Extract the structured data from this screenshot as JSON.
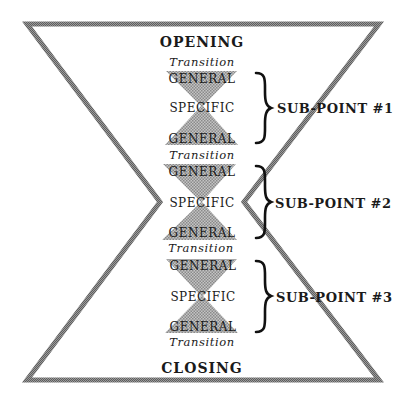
{
  "diagram": {
    "opening": "OPENING",
    "closing": "CLOSING",
    "transition_label": "Transition",
    "colors": {
      "frame": "#7a7a7a",
      "hatch": "#a8a8a8",
      "text": "#1a1a1a",
      "brace": "#111111"
    },
    "transitions": [
      "Transition",
      "Transition",
      "Transition",
      "Transition"
    ],
    "sub_points": [
      {
        "label": "SUB-POINT #1",
        "top": "GENERAL",
        "middle": "SPECIFIC",
        "bottom": "GENERAL"
      },
      {
        "label": "SUB-POINT #2",
        "top": "GENERAL",
        "middle": "SPECIFIC",
        "bottom": "GENERAL"
      },
      {
        "label": "SUB-POINT #3",
        "top": "GENERAL",
        "middle": "SPECIFIC",
        "bottom": "GENERAL"
      }
    ]
  }
}
